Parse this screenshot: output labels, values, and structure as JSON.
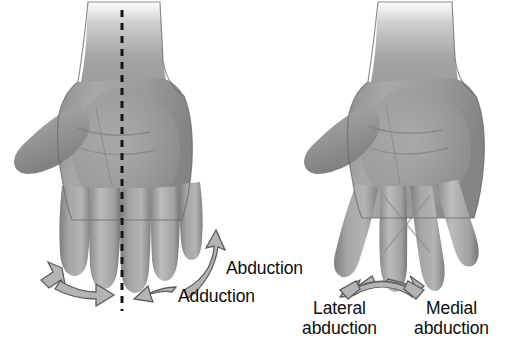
{
  "figure": {
    "background_color": "#ffffff",
    "width": 508,
    "height": 357
  },
  "palette": {
    "skin_light": "#d8d8d8",
    "skin_mid": "#9d9d9d",
    "skin_dark": "#6f6f6f",
    "outline": "#4a4a4a",
    "arrow_fill": "#b4b4b4",
    "arrow_outline": "#5d5d5d",
    "midline": "#151515",
    "text": "#0d0d0d"
  },
  "panels": [
    {
      "id": "left-panel",
      "name": "fingers-together-hand",
      "description": "Left palmar hand with fingers adducted together and dashed midline axis through the middle finger",
      "midline": {
        "visible": true,
        "style": "dashed",
        "x": 122,
        "y_start": 10,
        "y_end": 311
      }
    },
    {
      "id": "right-panel",
      "name": "fingers-spread-hand",
      "description": "Right palmar hand with fingers abducted and spread apart, middle fingers crossing",
      "midline": {
        "visible": false
      }
    }
  ],
  "labels": {
    "abduction": "Abduction",
    "adduction": "Adduction",
    "lateral_abduction_line1": "Lateral",
    "lateral_abduction_line2": "abduction",
    "medial_abduction_line1": "Medial",
    "medial_abduction_line2": "abduction"
  },
  "arrows": [
    {
      "name": "left-hand-outward-arrow",
      "type": "double-headed-curved",
      "directions": [
        "up-left",
        "down-right"
      ],
      "side": "left",
      "associated_label": ""
    },
    {
      "name": "abduction-adduction-arrow",
      "type": "double-headed-curved",
      "directions": [
        "up-right",
        "down-left"
      ],
      "side": "right",
      "associated_label": "Abduction / Adduction"
    },
    {
      "name": "lateral-medial-abduction-arrow",
      "type": "double-headed-curved",
      "directions": [
        "left",
        "right"
      ],
      "side": "center",
      "associated_label": "Lateral abduction / Medial abduction"
    }
  ]
}
